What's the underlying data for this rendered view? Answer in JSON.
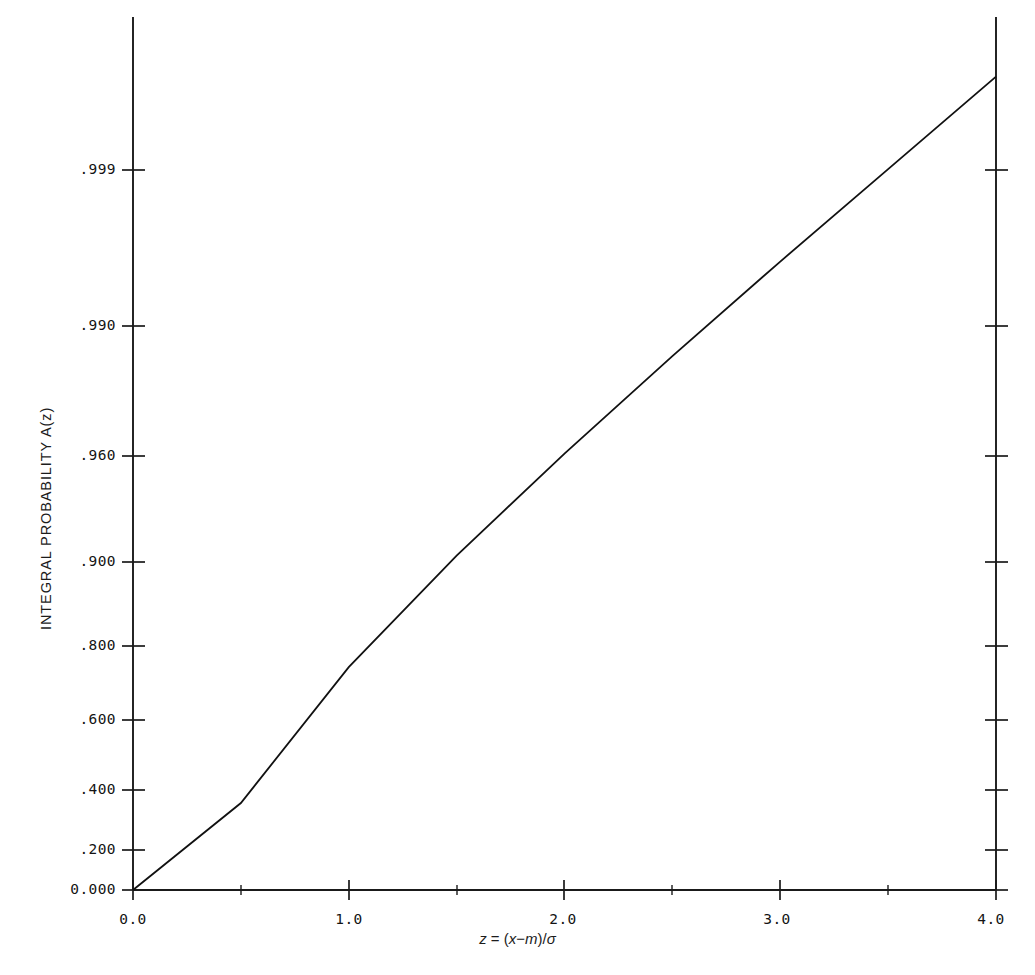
{
  "chart_data": {
    "type": "line",
    "title": "",
    "subtitle": "",
    "xlabel": "z = (x-m)/σ",
    "xlabel_parts": {
      "var": "z",
      "eq": " = (",
      "x": "x",
      "minus": "−",
      "m": "m",
      "close": ")/",
      "sigma": "σ"
    },
    "ylabel": "INTEGRAL PROBABILITY A(z)",
    "x": [
      0.0,
      0.5,
      1.0,
      1.5,
      2.0,
      2.5,
      3.0,
      3.5,
      4.0
    ],
    "values": [
      0.0,
      0.3829,
      0.6827,
      0.8664,
      0.9545,
      0.9876,
      0.9973,
      0.99953,
      0.999937
    ],
    "series": [
      {
        "name": "A(z) normal integral probability",
        "x": [
          0.0,
          0.5,
          1.0,
          1.5,
          2.0,
          2.5,
          3.0,
          3.5,
          4.0
        ],
        "values": [
          0.0,
          0.3829,
          0.6827,
          0.8664,
          0.9545,
          0.9876,
          0.9973,
          0.99953,
          0.999937
        ]
      }
    ],
    "xlim": [
      0.0,
      4.0
    ],
    "ylim": [
      0.0,
      0.99994
    ],
    "yscale": "probit",
    "grid": false,
    "legend": false,
    "legend_position": "none",
    "xticks": [
      {
        "value": 0.0,
        "label": "0.0"
      },
      {
        "value": 1.0,
        "label": "1.0"
      },
      {
        "value": 2.0,
        "label": "2.0"
      },
      {
        "value": 3.0,
        "label": "3.0"
      },
      {
        "value": 4.0,
        "label": "4.0"
      }
    ],
    "xminor": [
      0.5,
      1.5,
      2.5,
      3.5
    ],
    "yticks": [
      {
        "value": 0.999,
        "label": ".999",
        "py": 170
      },
      {
        "value": 0.99,
        "label": ".990",
        "py": 326
      },
      {
        "value": 0.96,
        "label": ".960",
        "py": 456
      },
      {
        "value": 0.9,
        "label": ".900",
        "py": 562
      },
      {
        "value": 0.8,
        "label": ".800",
        "py": 646
      },
      {
        "value": 0.6,
        "label": ".600",
        "py": 720
      },
      {
        "value": 0.4,
        "label": ".400",
        "py": 790
      },
      {
        "value": 0.2,
        "label": ".200",
        "py": 850
      },
      {
        "value": 0.0,
        "label": "0.000",
        "py": 890
      }
    ],
    "line_color": "#111111",
    "axis_color": "#1a1a1a",
    "background_color": "#ffffff"
  },
  "labels": {
    "y_999": ".999",
    "y_990": ".990",
    "y_960": ".960",
    "y_900": ".900",
    "y_800": ".800",
    "y_600": ".600",
    "y_400": ".400",
    "y_200": ".200",
    "y_000": "0.000",
    "x_00": "0.0",
    "x_10": "1.0",
    "x_20": "2.0",
    "x_30": "3.0",
    "x_40": "4.0",
    "ylabel": "INTEGRAL PROBABILITY A(z)",
    "xlabel_z": "z",
    "xlabel_eq": " = (",
    "xlabel_x": "x",
    "xlabel_minus": "−",
    "xlabel_m": "m",
    "xlabel_close": ")/",
    "xlabel_sigma": "σ"
  }
}
